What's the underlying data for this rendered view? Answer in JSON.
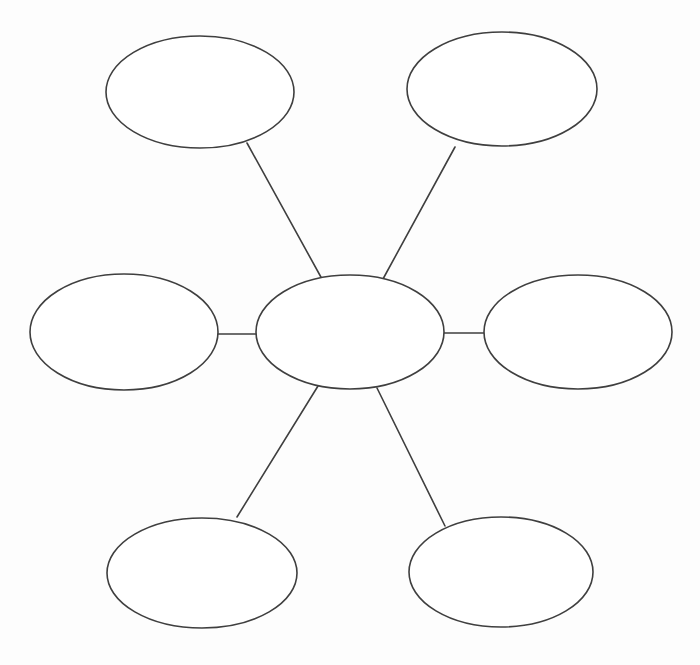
{
  "page": {
    "background_color": "#fdfdfd"
  },
  "diagram": {
    "type": "spider-map-graphic-organizer",
    "stroke_color": "#3f3f3f",
    "node_fill_color": "#ffffff",
    "nodes": {
      "center": {
        "label": ""
      },
      "top_left": {
        "label": ""
      },
      "top_right": {
        "label": ""
      },
      "left": {
        "label": ""
      },
      "right": {
        "label": ""
      },
      "bottom_left": {
        "label": ""
      },
      "bottom_right": {
        "label": ""
      }
    },
    "connections": [
      {
        "from": "center",
        "to": "top_left"
      },
      {
        "from": "center",
        "to": "top_right"
      },
      {
        "from": "center",
        "to": "left"
      },
      {
        "from": "center",
        "to": "right"
      },
      {
        "from": "center",
        "to": "bottom_left"
      },
      {
        "from": "center",
        "to": "bottom_right"
      }
    ]
  }
}
